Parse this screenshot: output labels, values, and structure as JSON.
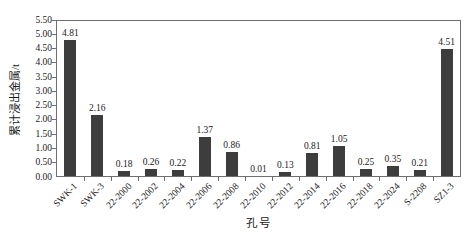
{
  "chart_data": {
    "type": "bar",
    "title": "",
    "xlabel": "孔号",
    "ylabel": "累计浸出金属/t",
    "categories": [
      "SWK-1",
      "SWK-3",
      "22-2000",
      "22-2002",
      "22-2004",
      "22-2006",
      "22-2008",
      "22-2010",
      "22-2012",
      "22-2014",
      "22-2016",
      "22-2018",
      "22-2024",
      "S-2208",
      "SZ1-3"
    ],
    "values": [
      4.81,
      2.16,
      0.18,
      0.26,
      0.22,
      1.37,
      0.86,
      0.01,
      0.13,
      0.81,
      1.05,
      0.25,
      0.35,
      0.21,
      4.51
    ],
    "value_labels": [
      "4.81",
      "2.16",
      "0.18",
      "0.26",
      "0.22",
      "1.37",
      "0.86",
      "0.01",
      "0.13",
      "0.81",
      "1.05",
      "0.25",
      "0.35",
      "0.21",
      "4.51"
    ],
    "ylim": [
      0,
      5.5
    ],
    "ytick_labels": [
      "0.00",
      "0.50",
      "1.00",
      "1.50",
      "2.00",
      "2.50",
      "3.00",
      "3.50",
      "4.00",
      "4.50",
      "5.00",
      "5.50"
    ],
    "grid": false,
    "legend": null,
    "bar_color": "#3d3d3d",
    "axis_color": "#6e6e6e"
  }
}
